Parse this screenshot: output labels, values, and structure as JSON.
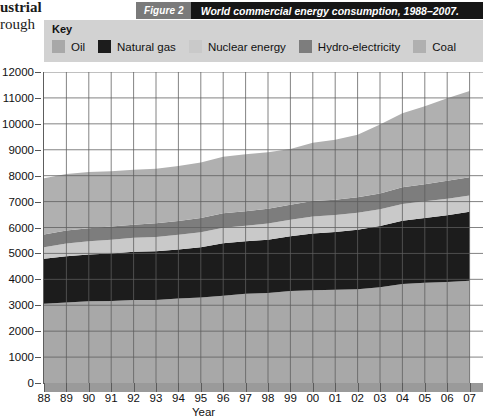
{
  "page_bleed": {
    "line1": "ustrial",
    "line2": "rough"
  },
  "caption": {
    "number": "Figure 2",
    "title": "World commercial energy consumption, 1988–2007.",
    "number_bg": "#7a7a7a",
    "title_bg": "#161616",
    "text_color": "#ffffff"
  },
  "key": {
    "title": "Key",
    "background": "#d2d2d2",
    "items": [
      {
        "label": "Oil",
        "color": "#a8a8a8"
      },
      {
        "label": "Natural gas",
        "color": "#1c1c1c"
      },
      {
        "label": "Nuclear energy",
        "color": "#c9c9c9"
      },
      {
        "label": "Hydro-electricity",
        "color": "#7d7d7d"
      },
      {
        "label": "Coal",
        "color": "#b0b0b0"
      }
    ]
  },
  "axes": {
    "y_title": "million tonnes oil equivalent",
    "x_title": "Year",
    "y_ticks": [
      "0",
      "1000",
      "2000",
      "3000",
      "4000",
      "5000",
      "6000",
      "7000",
      "8000",
      "9000",
      "10000",
      "11000",
      "12000"
    ],
    "x_ticks": [
      "88",
      "89",
      "90",
      "91",
      "92",
      "93",
      "94",
      "95",
      "96",
      "97",
      "98",
      "99",
      "00",
      "01",
      "02",
      "03",
      "04",
      "05",
      "06",
      "07"
    ],
    "grid_color": "#5d5d5d",
    "axis_color": "#5b5b5b"
  },
  "chart_data": {
    "type": "area",
    "title": "World commercial energy consumption, 1988–2007.",
    "subtitle": "Figure 2",
    "xlabel": "Year",
    "ylabel": "million tonnes oil equivalent",
    "ylim": [
      0,
      12000
    ],
    "xlim": [
      1988,
      2007
    ],
    "grid": true,
    "stacked": true,
    "legend_position": "top",
    "x": [
      1988,
      1989,
      1990,
      1991,
      1992,
      1993,
      1994,
      1995,
      1996,
      1997,
      1998,
      1999,
      2000,
      2001,
      2002,
      2003,
      2004,
      2005,
      2006,
      2007
    ],
    "categories": [
      "88",
      "89",
      "90",
      "91",
      "92",
      "93",
      "94",
      "95",
      "96",
      "97",
      "98",
      "99",
      "00",
      "01",
      "02",
      "03",
      "04",
      "05",
      "06",
      "07"
    ],
    "series": [
      {
        "name": "Oil",
        "color": "#a8a8a8",
        "values": [
          3060,
          3110,
          3150,
          3160,
          3200,
          3200,
          3260,
          3300,
          3370,
          3440,
          3470,
          3550,
          3580,
          3600,
          3620,
          3690,
          3820,
          3870,
          3900,
          3950
        ]
      },
      {
        "name": "Natural gas",
        "color": "#1c1c1c",
        "values": [
          1730,
          1780,
          1810,
          1840,
          1860,
          1880,
          1890,
          1940,
          2020,
          2030,
          2060,
          2110,
          2190,
          2230,
          2290,
          2370,
          2440,
          2500,
          2570,
          2660
        ]
      },
      {
        "name": "Nuclear energy",
        "color": "#c9c9c9",
        "values": [
          450,
          490,
          510,
          530,
          540,
          550,
          570,
          580,
          600,
          600,
          620,
          640,
          650,
          650,
          660,
          640,
          650,
          640,
          640,
          620
        ]
      },
      {
        "name": "Hydro-electricity",
        "color": "#7d7d7d",
        "values": [
          490,
          500,
          500,
          510,
          510,
          530,
          530,
          550,
          560,
          560,
          570,
          580,
          600,
          590,
          600,
          610,
          640,
          660,
          690,
          710
        ]
      },
      {
        "name": "Coal",
        "color": "#b0b0b0",
        "values": [
          2170,
          2180,
          2170,
          2130,
          2120,
          2110,
          2120,
          2140,
          2180,
          2200,
          2180,
          2150,
          2250,
          2320,
          2410,
          2660,
          2860,
          3010,
          3190,
          3330
        ]
      }
    ],
    "totals": [
      7900,
      8060,
      8140,
      8170,
      8230,
      8270,
      8370,
      8510,
      8730,
      8830,
      8900,
      9030,
      9270,
      9390,
      9580,
      9970,
      10410,
      10680,
      10990,
      11270
    ]
  }
}
